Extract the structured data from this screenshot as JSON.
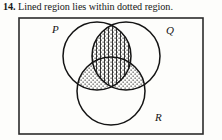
{
  "exercise": {
    "number": "14.",
    "statement": "Lined region lies within dotted region."
  },
  "figure": {
    "universe_label": "",
    "border_color": "#2b2b2b",
    "stroke_color": "#141414",
    "background_color": "#fdfdfb",
    "sets": [
      {
        "id": "P",
        "label": "P",
        "label_x": 52,
        "label_y": 18,
        "cx": 97,
        "cy": 41,
        "r": 34
      },
      {
        "id": "Q",
        "label": "Q",
        "label_x": 166,
        "label_y": 19,
        "cx": 126,
        "cy": 41,
        "r": 34
      },
      {
        "id": "R",
        "label": "R",
        "label_x": 155,
        "label_y": 106,
        "cx": 111,
        "cy": 76,
        "r": 34
      }
    ],
    "regions": [
      {
        "id": "P-and-Q",
        "fill": "dots-and-vertical-lines",
        "description": "P intersect Q"
      },
      {
        "id": "P-and-R",
        "fill": "dots",
        "description": "P intersect R"
      },
      {
        "id": "Q-and-R",
        "fill": "dots",
        "description": "Q intersect R"
      },
      {
        "id": "P-and-Q-and-R",
        "fill": "dots-and-vertical-lines",
        "description": "P intersect Q intersect R"
      }
    ],
    "legend": {
      "lined_region": "P ∩ Q",
      "dotted_region": "(P ∩ Q) ∪ (P ∩ R) ∪ (Q ∩ R)"
    }
  }
}
